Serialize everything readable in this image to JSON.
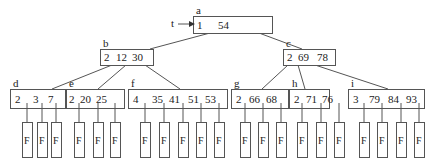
{
  "root_pointer": {
    "label": "t",
    "x": 175,
    "y": 24,
    "arrow_to_x": 195
  },
  "leaf_marker": "F",
  "colors": {
    "stroke": "#555555",
    "text": "#222222",
    "background": "#ffffff"
  },
  "nodes": [
    {
      "id": "a",
      "label": "a",
      "x": 193,
      "y": 16,
      "w": 79,
      "h": 17,
      "keys": [
        "1",
        "54"
      ],
      "key_x": [
        4,
        25
      ]
    },
    {
      "id": "b",
      "label": "b",
      "x": 100,
      "y": 49,
      "w": 53,
      "h": 16,
      "keys": [
        "2",
        "12",
        "30"
      ],
      "key_x": [
        4,
        16,
        32
      ]
    },
    {
      "id": "c",
      "label": "c",
      "x": 283,
      "y": 49,
      "w": 52,
      "h": 16,
      "keys": [
        "2",
        "69",
        "78"
      ],
      "key_x": [
        4,
        15,
        34
      ]
    },
    {
      "id": "d",
      "label": "d",
      "x": 10,
      "y": 89,
      "w": 55,
      "h": 19,
      "keys": [
        "2",
        "3",
        "7"
      ],
      "key_x": [
        5,
        23,
        38
      ]
    },
    {
      "id": "e",
      "label": "e",
      "x": 66,
      "y": 89,
      "w": 58,
      "h": 19,
      "keys": [
        "2",
        "20",
        "25"
      ],
      "key_x": [
        3,
        14,
        30
      ]
    },
    {
      "id": "f",
      "label": "f",
      "x": 128,
      "y": 89,
      "w": 99,
      "h": 19,
      "keys": [
        "4",
        "35",
        "41",
        "51",
        "53"
      ],
      "key_x": [
        5,
        24,
        41,
        60,
        77
      ]
    },
    {
      "id": "g",
      "label": "g",
      "x": 231,
      "y": 89,
      "w": 57,
      "h": 19,
      "keys": [
        "2",
        "66",
        "68"
      ],
      "key_x": [
        5,
        18,
        35
      ]
    },
    {
      "id": "h",
      "label": "h",
      "x": 289,
      "y": 89,
      "w": 40,
      "h": 19,
      "keys": [
        "2",
        "71",
        "76"
      ],
      "key_x": [
        5,
        17,
        33
      ]
    },
    {
      "id": "i",
      "label": "i",
      "x": 348,
      "y": 89,
      "w": 76,
      "h": 19,
      "keys": [
        "3",
        "79",
        "84",
        "93"
      ],
      "key_x": [
        5,
        21,
        40,
        58
      ]
    }
  ],
  "edges": [
    {
      "from": [
        210,
        33
      ],
      "to": [
        150,
        49
      ]
    },
    {
      "from": [
        259,
        33
      ],
      "to": [
        302,
        49
      ]
    },
    {
      "from": [
        112,
        65
      ],
      "to": [
        52,
        89
      ]
    },
    {
      "from": [
        126,
        65
      ],
      "to": [
        98,
        89
      ]
    },
    {
      "from": [
        145,
        65
      ],
      "to": [
        180,
        89
      ]
    },
    {
      "from": [
        288,
        65
      ],
      "to": [
        262,
        89
      ]
    },
    {
      "from": [
        298,
        65
      ],
      "to": [
        305,
        89
      ]
    },
    {
      "from": [
        315,
        65
      ],
      "to": [
        388,
        89
      ]
    }
  ],
  "leaf_groups": [
    {
      "node": "d",
      "fx": [
        22,
        37,
        51
      ]
    },
    {
      "node": "e",
      "fx": [
        74,
        93,
        110
      ]
    },
    {
      "node": "f",
      "fx": [
        140,
        159,
        178,
        196,
        214
      ]
    },
    {
      "node": "g",
      "fx": [
        240,
        258,
        276
      ]
    },
    {
      "node": "h",
      "fx": [
        297,
        316,
        334
      ]
    },
    {
      "node": "i",
      "fx": [
        359,
        377,
        396,
        414
      ]
    }
  ],
  "fbox": {
    "y": 122,
    "w": 10,
    "h": 35
  }
}
